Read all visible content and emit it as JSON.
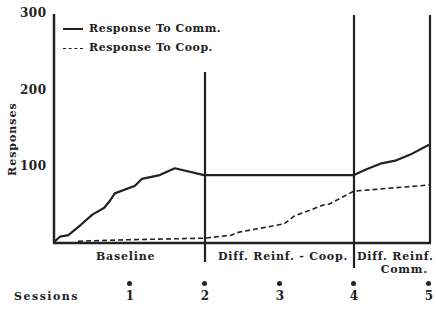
{
  "chart_data": {
    "type": "line",
    "title": "",
    "xlabel": "Sessions",
    "ylabel": "Responses",
    "ylim": [
      0,
      300
    ],
    "yticks": [
      "100",
      "200",
      "300"
    ],
    "xticks": [
      "1",
      "2",
      "3",
      "4",
      "5"
    ],
    "grid": false,
    "legend_position": "top-left",
    "legend": [
      "Response To Comm.",
      "Response To Coop."
    ],
    "phases": [
      {
        "label": "Baseline",
        "start_session": 0,
        "end_session": 2
      },
      {
        "label": "Diff. Reinf. - Coop.",
        "start_session": 2,
        "end_session": 4
      },
      {
        "label": "Diff. Reinf. Comm.",
        "label_line1": "Diff. Reinf.",
        "label_line2": "Comm.",
        "start_session": 4,
        "end_session": 5
      }
    ],
    "series": [
      {
        "name": "Response To Comm.",
        "style": "solid",
        "x": [
          0,
          0.08,
          0.19,
          0.35,
          0.51,
          0.67,
          0.75,
          0.81,
          1.08,
          1.17,
          1.41,
          1.61,
          2.0,
          3.0,
          4.0,
          4.15,
          4.35,
          4.55,
          4.75,
          5.0
        ],
        "values": [
          0,
          7,
          9,
          22,
          36,
          45,
          55,
          64,
          74,
          83,
          88,
          97,
          88,
          88,
          88,
          95,
          103,
          107,
          115,
          128
        ]
      },
      {
        "name": "Response To Coop.",
        "style": "dashed",
        "x": [
          0.32,
          1.0,
          2.0,
          2.36,
          2.47,
          3.07,
          3.2,
          3.6,
          3.67,
          4.0,
          5.0
        ],
        "values": [
          1,
          3,
          5,
          9,
          13,
          24,
          34,
          49,
          50,
          67,
          75
        ]
      }
    ]
  },
  "legend": {
    "comm_label": "Response To Comm.",
    "coop_label": "Response To Coop."
  },
  "axes": {
    "y_label": "Responses",
    "y_tick_300": "300",
    "y_tick_200": "200",
    "y_tick_100": "100",
    "x_label": "Sessions",
    "x_ticks": [
      "1",
      "2",
      "3",
      "4",
      "5"
    ]
  },
  "phases": {
    "baseline": "Baseline",
    "diff_reinf_coop": "Diff. Reinf. - Coop.",
    "diff_reinf_comm_line1": "Diff. Reinf.",
    "diff_reinf_comm_line2": "Comm."
  }
}
